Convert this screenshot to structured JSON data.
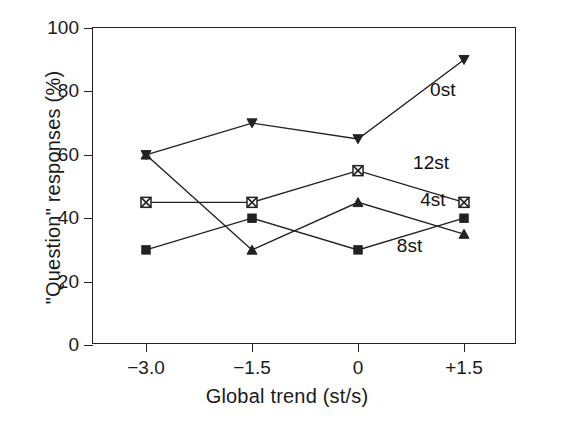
{
  "chart_data": {
    "type": "line",
    "title": "",
    "xlabel": "Global trend (st/s)",
    "ylabel": "\"Question\" responses (%)",
    "x": [
      -3.0,
      -1.5,
      0,
      1.5
    ],
    "xtick_labels": [
      "−3.0",
      "−1.5",
      "0",
      "+1.5"
    ],
    "ytick_labels": [
      "0",
      "20",
      "40",
      "60",
      "80",
      "100"
    ],
    "yticks": [
      0,
      20,
      40,
      60,
      80,
      100
    ],
    "xlim": [
      -3.75,
      2.25
    ],
    "ylim": [
      0,
      100
    ],
    "grid": false,
    "legend_position": "inline-annotations",
    "line_color": "#222222",
    "series": [
      {
        "name": "0st",
        "label": "0st",
        "marker": "triangle-down-filled",
        "values": [
          60,
          70,
          65,
          90
        ],
        "label_x": 1.02,
        "label_y": 80
      },
      {
        "name": "12st",
        "label": "12st",
        "marker": "square-crossed",
        "values": [
          45,
          45,
          55,
          45
        ],
        "label_x": 0.78,
        "label_y": 57
      },
      {
        "name": "4st",
        "label": "4st",
        "marker": "triangle-up-filled",
        "values": [
          60,
          30,
          45,
          35
        ],
        "label_x": 0.88,
        "label_y": 45.5
      },
      {
        "name": "8st",
        "label": "8st",
        "marker": "square-filled",
        "values": [
          30,
          40,
          30,
          40
        ],
        "label_x": 0.55,
        "label_y": 31
      }
    ]
  }
}
